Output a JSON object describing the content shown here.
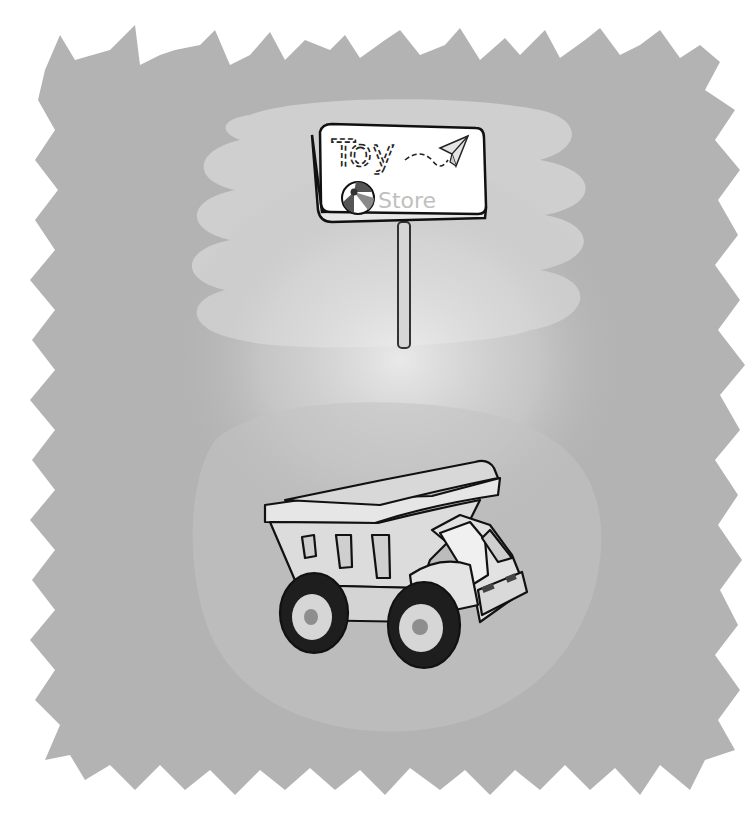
{
  "illustration": {
    "description": "Grayscale clip-art scene: toy store sign on a post above a toy dump truck, on a ragged gray background",
    "sign": {
      "line1": "Toy",
      "line2": "Store",
      "icons": [
        "paper-plane",
        "beach-ball"
      ]
    },
    "subject": "dump-truck"
  },
  "colors": {
    "background_outer": "#ffffff",
    "background_splash": "#b3b3b3",
    "highlight_cloud": "#d2d2d2",
    "glow_center": "#e6e6e6",
    "sign_face": "#ffffff",
    "outline": "#111111",
    "truck_body": "#dcdcdc",
    "tire": "#1e1e1e",
    "hub": "#d0d0d0",
    "hub_center": "#8e8e8e",
    "store_text": "#bdbdbd"
  }
}
